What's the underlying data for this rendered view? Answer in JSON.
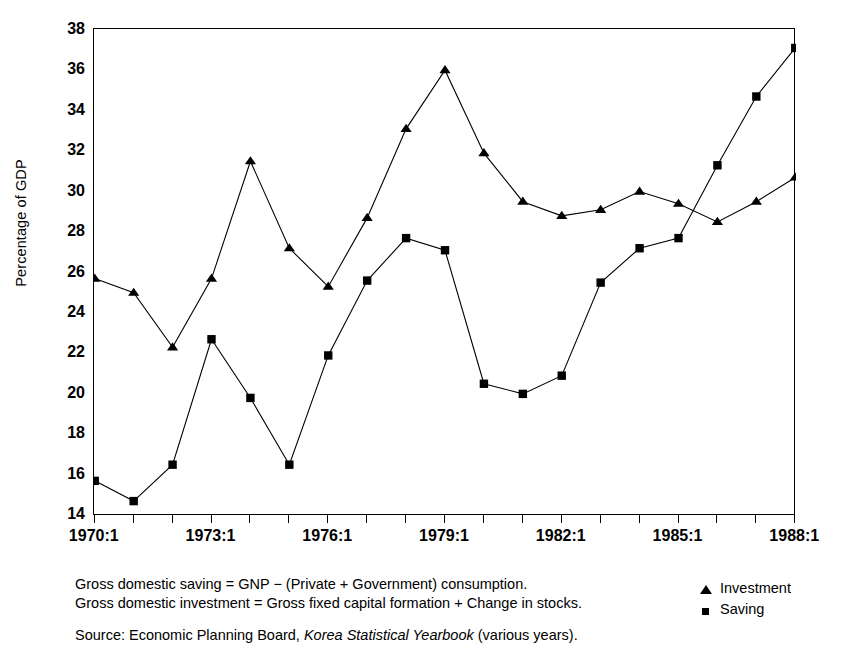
{
  "chart_data": {
    "type": "line",
    "title": "",
    "xlabel": "",
    "ylabel": "Percentage of GDP",
    "ylim": [
      14,
      38
    ],
    "ytick_step": 2,
    "yticks": [
      14,
      16,
      18,
      20,
      22,
      24,
      26,
      28,
      30,
      32,
      34,
      36,
      38
    ],
    "grid": false,
    "legend_position": "bottom-right",
    "x_tick_labels": [
      "1970:1",
      "1973:1",
      "1976:1",
      "1979:1",
      "1982:1",
      "1985:1",
      "1988:1"
    ],
    "x_tick_label_indices": [
      0,
      3,
      6,
      9,
      12,
      15,
      18
    ],
    "x_tick_count": 19,
    "x": [
      "1970:1",
      "1971:1",
      "1972:1",
      "1973:1",
      "1974:1",
      "1975:1",
      "1976:1",
      "1977:1",
      "1978:1",
      "1979:1",
      "1980:1",
      "1981:1",
      "1982:1",
      "1983:1",
      "1984:1",
      "1985:1",
      "1986:1",
      "1987:1",
      "1988:1"
    ],
    "series": [
      {
        "name": "Investment",
        "marker": "triangle",
        "color": "#000000",
        "values": [
          25.7,
          25.0,
          22.3,
          25.7,
          31.5,
          27.2,
          25.3,
          28.7,
          33.1,
          36.0,
          31.9,
          29.5,
          28.8,
          29.1,
          30.0,
          29.4,
          28.5,
          29.5,
          30.7
        ]
      },
      {
        "name": "Saving",
        "marker": "square",
        "color": "#000000",
        "values": [
          15.7,
          14.7,
          16.5,
          22.7,
          19.8,
          16.5,
          21.9,
          25.6,
          27.7,
          27.1,
          20.5,
          20.0,
          20.9,
          25.5,
          27.2,
          27.7,
          31.3,
          34.7,
          37.1
        ]
      }
    ]
  },
  "notes": {
    "line1": "Gross domestic saving = GNP − (Private + Government) consumption.",
    "line2": "Gross domestic investment = Gross fixed capital formation + Change in stocks.",
    "source_prefix": "Source: Economic Planning Board, ",
    "source_italic": "Korea Statistical Yearbook",
    "source_suffix": " (various years)."
  },
  "legend": {
    "items": [
      {
        "label": "Investment",
        "marker": "triangle"
      },
      {
        "label": "Saving",
        "marker": "square"
      }
    ]
  }
}
